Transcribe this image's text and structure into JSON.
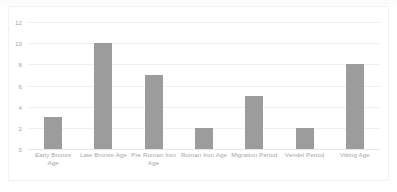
{
  "chart_data": {
    "type": "bar",
    "title": "",
    "subtitle": "",
    "xlabel": "",
    "ylabel": "",
    "categories": [
      "Early Bronze Age",
      "Late  Bronze Age",
      "Pre Roman Iron Age",
      "Roman Iron Age",
      "Migration Period",
      "Vendel Period",
      "Viking Age"
    ],
    "values": [
      3,
      10,
      7,
      2,
      5,
      2,
      8
    ],
    "ylim": [
      0,
      12
    ],
    "ytick_labels": [
      "0",
      "2",
      "4",
      "6",
      "8",
      "10",
      "12"
    ],
    "ytick_values": [
      0,
      2,
      4,
      6,
      8,
      10,
      12
    ],
    "grid": true,
    "legend": false,
    "legend_position": "none",
    "bar_color": "#9c9c9c",
    "gridline_color": "#f0f0f0",
    "axis_text_color": "#a6a6a6",
    "background_color": "#ffffff",
    "frame_color": "#f2f2f2"
  }
}
